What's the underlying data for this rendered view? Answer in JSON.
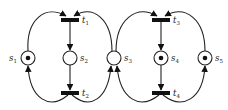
{
  "diagram": {
    "type": "petri-net",
    "colors": {
      "stroke": "#222222",
      "background": "#ffffff"
    },
    "places": [
      {
        "id": "s1",
        "name": "s",
        "sub": "1",
        "x": 28,
        "y": 58,
        "tokens": 1
      },
      {
        "id": "s2",
        "name": "s",
        "sub": "2",
        "x": 70,
        "y": 58,
        "tokens": 0
      },
      {
        "id": "s3",
        "name": "s",
        "sub": "3",
        "x": 114,
        "y": 58,
        "tokens": 0
      },
      {
        "id": "s4",
        "name": "s",
        "sub": "4",
        "x": 161,
        "y": 58,
        "tokens": 1
      },
      {
        "id": "s5",
        "name": "s",
        "sub": "5",
        "x": 205,
        "y": 58,
        "tokens": 1
      }
    ],
    "transitions": [
      {
        "id": "t1",
        "name": "t",
        "sub": "1",
        "x": 70,
        "y": 20
      },
      {
        "id": "t2",
        "name": "t",
        "sub": "2",
        "x": 70,
        "y": 93
      },
      {
        "id": "t3",
        "name": "t",
        "sub": "3",
        "x": 161,
        "y": 20
      },
      {
        "id": "t4",
        "name": "t",
        "sub": "4",
        "x": 161,
        "y": 93
      }
    ],
    "arcs": [
      [
        "s1",
        "t1"
      ],
      [
        "t1",
        "s2"
      ],
      [
        "s2",
        "t2"
      ],
      [
        "t2",
        "s1"
      ],
      [
        "t2",
        "s3"
      ],
      [
        "s3",
        "t1"
      ],
      [
        "s3",
        "t3"
      ],
      [
        "t3",
        "s4"
      ],
      [
        "s4",
        "t4"
      ],
      [
        "t4",
        "s3"
      ],
      [
        "t4",
        "s5"
      ],
      [
        "s5",
        "t3"
      ]
    ]
  }
}
